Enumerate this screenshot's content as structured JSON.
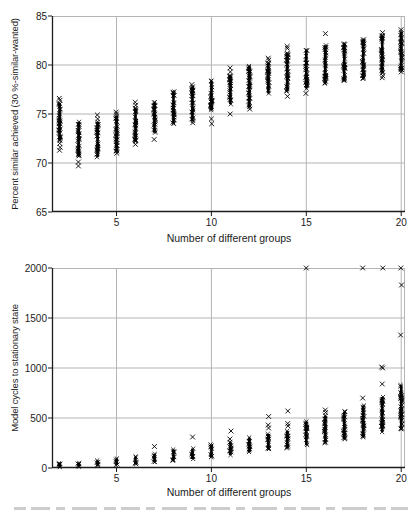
{
  "colors": {
    "background": "#ffffff",
    "marker": "#000000",
    "grid": "#b4b4b4",
    "axis": "#1c1c1c",
    "text": "#1c1c1c"
  },
  "caption": {
    "visible_text": "",
    "note_cut_off": true
  },
  "chart_data": [
    {
      "type": "scatter",
      "marker": "x",
      "title": "",
      "xlabel": "Number of different groups",
      "ylabel": "Percent similar achieved (30 %-similar-wanted)",
      "xlim": [
        1.6,
        20.2
      ],
      "ylim": [
        65,
        85
      ],
      "xticks": [
        5,
        10,
        15,
        20
      ],
      "yticks": [
        65,
        70,
        75,
        80,
        85
      ],
      "grid": true,
      "legend": null,
      "clusters": [
        {
          "x": 2,
          "dense": [
            72.3,
            76.1
          ],
          "below": [
            71.3,
            71.6,
            72.0
          ],
          "above": [
            76.4,
            76.6
          ]
        },
        {
          "x": 3,
          "dense": [
            70.7,
            74.2
          ],
          "below": [
            69.7,
            70.1
          ],
          "above": []
        },
        {
          "x": 4,
          "dense": [
            70.6,
            74.2
          ],
          "below": [],
          "above": [
            74.5,
            74.9
          ]
        },
        {
          "x": 5,
          "dense": [
            71.2,
            74.8
          ],
          "below": [
            71.0
          ],
          "above": [
            75.0,
            75.2
          ]
        },
        {
          "x": 6,
          "dense": [
            72.2,
            75.6
          ],
          "below": [
            71.9
          ],
          "above": [
            75.9,
            76.2
          ]
        },
        {
          "x": 7,
          "dense": [
            73.1,
            76.2
          ],
          "below": [
            72.4
          ],
          "above": []
        },
        {
          "x": 8,
          "dense": [
            74.0,
            77.3
          ],
          "below": [],
          "above": []
        },
        {
          "x": 9,
          "dense": [
            74.3,
            77.8
          ],
          "below": [
            74.1
          ],
          "above": [
            78.0
          ]
        },
        {
          "x": 10,
          "dense": [
            75.4,
            78.4
          ],
          "below": [
            74.0,
            74.5
          ],
          "above": []
        },
        {
          "x": 11,
          "dense": [
            76.0,
            78.9
          ],
          "below": [
            75.0
          ],
          "above": [
            79.3,
            79.7
          ]
        },
        {
          "x": 12,
          "dense": [
            75.7,
            79.9
          ],
          "below": [
            75.5
          ],
          "above": []
        },
        {
          "x": 13,
          "dense": [
            77.1,
            80.2
          ],
          "below": [],
          "above": [
            80.5,
            80.7
          ]
        },
        {
          "x": 14,
          "dense": [
            77.3,
            81.2
          ],
          "below": [
            76.8
          ],
          "above": [
            81.7,
            81.9
          ]
        },
        {
          "x": 15,
          "dense": [
            77.6,
            81.5
          ],
          "below": [
            77.1
          ],
          "above": []
        },
        {
          "x": 16,
          "dense": [
            78.1,
            82.0
          ],
          "below": [],
          "above": [
            83.2
          ]
        },
        {
          "x": 17,
          "dense": [
            78.4,
            82.2
          ],
          "below": [],
          "above": []
        },
        {
          "x": 18,
          "dense": [
            78.6,
            82.6
          ],
          "below": [],
          "above": []
        },
        {
          "x": 19,
          "dense": [
            79.2,
            83.0
          ],
          "below": [
            78.7,
            78.9
          ],
          "above": [
            83.3
          ]
        },
        {
          "x": 20,
          "dense": [
            79.5,
            83.4
          ],
          "below": [
            79.3
          ],
          "above": [
            83.6
          ]
        }
      ]
    },
    {
      "type": "scatter",
      "marker": "x",
      "title": "",
      "xlabel": "Number of different groups",
      "ylabel": "Model cycles to stationary state",
      "xlim": [
        1.6,
        20.2
      ],
      "ylim": [
        0,
        2000
      ],
      "xticks": [
        5,
        10,
        15,
        20
      ],
      "yticks": [
        0,
        500,
        1000,
        1500,
        2000
      ],
      "grid": true,
      "legend": null,
      "clusters": [
        {
          "x": 2,
          "dense": [
            10,
            45
          ],
          "below": [],
          "above": []
        },
        {
          "x": 3,
          "dense": [
            15,
            50
          ],
          "below": [],
          "above": []
        },
        {
          "x": 4,
          "dense": [
            25,
            75
          ],
          "below": [],
          "above": []
        },
        {
          "x": 5,
          "dense": [
            30,
            95
          ],
          "below": [],
          "above": []
        },
        {
          "x": 6,
          "dense": [
            40,
            115
          ],
          "below": [],
          "above": []
        },
        {
          "x": 7,
          "dense": [
            60,
            140
          ],
          "below": [],
          "above": [
            215
          ]
        },
        {
          "x": 8,
          "dense": [
            75,
            185
          ],
          "below": [],
          "above": []
        },
        {
          "x": 9,
          "dense": [
            90,
            195
          ],
          "below": [],
          "above": [
            310
          ]
        },
        {
          "x": 10,
          "dense": [
            110,
            235
          ],
          "below": [],
          "above": []
        },
        {
          "x": 11,
          "dense": [
            130,
            260
          ],
          "below": [],
          "above": [
            290,
            370
          ]
        },
        {
          "x": 12,
          "dense": [
            160,
            305
          ],
          "below": [],
          "above": []
        },
        {
          "x": 13,
          "dense": [
            190,
            340
          ],
          "below": [],
          "above": [
            400,
            430,
            515
          ]
        },
        {
          "x": 14,
          "dense": [
            200,
            370
          ],
          "below": [],
          "above": [
            420,
            445,
            570
          ]
        },
        {
          "x": 15,
          "dense": [
            230,
            465
          ],
          "below": [],
          "above": [
            2000
          ]
        },
        {
          "x": 16,
          "dense": [
            250,
            525
          ],
          "below": [],
          "above": [
            555,
            580
          ]
        },
        {
          "x": 17,
          "dense": [
            290,
            565
          ],
          "below": [],
          "above": []
        },
        {
          "x": 18,
          "dense": [
            310,
            625
          ],
          "below": [],
          "above": [
            700,
            2000
          ]
        },
        {
          "x": 19,
          "dense": [
            360,
            710
          ],
          "below": [],
          "above": [
            840,
            1000,
            1010,
            2000
          ]
        },
        {
          "x": 20,
          "dense": [
            390,
            830
          ],
          "below": [],
          "above": [
            1330,
            1830,
            2000
          ]
        }
      ]
    }
  ]
}
